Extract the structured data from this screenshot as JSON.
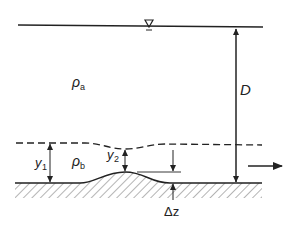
{
  "diagram": {
    "type": "two-layer stratified flow over a bed bump",
    "labels": {
      "free_surface_symbol": "∇",
      "upper_density": "ρ",
      "upper_density_sub": "a",
      "lower_density": "ρ",
      "lower_density_sub": "b",
      "total_depth": "D",
      "upstream_depth": "y",
      "upstream_depth_sub": "1",
      "crest_depth": "y",
      "crest_depth_sub": "2",
      "bump_height": "Δz"
    },
    "elements": [
      "free-surface line",
      "dashed density interface",
      "hatched channel bed with bump",
      "flow direction arrow (left to right)",
      "dimension arrows: D, y1, y2, Δz"
    ],
    "colors": {
      "line": "#222222",
      "background": "#ffffff"
    }
  }
}
